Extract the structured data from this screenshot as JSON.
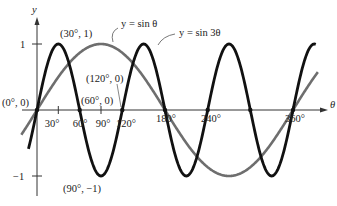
{
  "chart_data": {
    "type": "line",
    "title": "",
    "xlabel": "θ",
    "ylabel": "y",
    "xlim": [
      0,
      360
    ],
    "ylim": [
      -1,
      1
    ],
    "x_ticks": [
      "30°",
      "60°",
      "90°",
      "120°",
      "180°",
      "240°",
      "360°"
    ],
    "y_ticks": [
      "1",
      "-1"
    ],
    "series": [
      {
        "name": "y = sin θ",
        "function": "sin(θ)",
        "color": "#6e6e6e"
      },
      {
        "name": "y = sin 3θ",
        "function": "sin(3θ)",
        "color": "#111111"
      }
    ],
    "annotations": [
      {
        "label": "(0°, 0)",
        "x": 0,
        "y": 0
      },
      {
        "label": "(30°, 1)",
        "x": 30,
        "y": 1
      },
      {
        "label": "(60°, 0)",
        "x": 60,
        "y": 0
      },
      {
        "label": "(90°, −1)",
        "x": 90,
        "y": -1
      },
      {
        "label": "(120°, 0)",
        "x": 120,
        "y": 0
      }
    ],
    "grid": false,
    "legend_position": "inline-top"
  },
  "axes": {
    "x_label": "θ",
    "y_label": "y",
    "y_tick_pos": "1",
    "y_tick_neg": "−1",
    "x_ticks": {
      "t30": "30°",
      "t60": "60°",
      "t90": "90°",
      "t120": "120°",
      "t180": "180°",
      "t240": "240°",
      "t360": "360°"
    }
  },
  "legend": {
    "sin": "y = sin θ",
    "sin3": "y = sin 3θ"
  },
  "points": {
    "origin": "(0°, 0)",
    "p30": "(30°, 1)",
    "p60": "(60°, 0)",
    "p90": "(90°, −1)",
    "p120": "(120°, 0)"
  }
}
